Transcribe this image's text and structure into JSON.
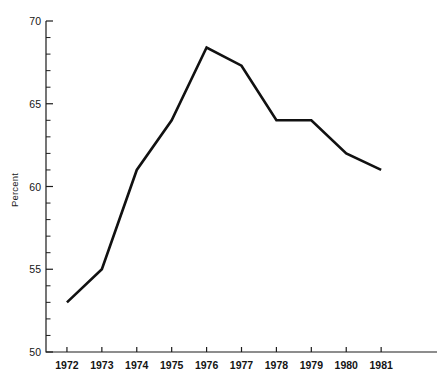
{
  "chart_data": {
    "type": "line",
    "title": "",
    "subtitle": "",
    "xlabel": "",
    "ylabel": "Percent",
    "x": [
      1972,
      1973,
      1974,
      1975,
      1976,
      1977,
      1978,
      1979,
      1980,
      1981
    ],
    "categories": [
      "1972",
      "1973",
      "1974",
      "1975",
      "1976",
      "1977",
      "1978",
      "1979",
      "1980",
      "1981"
    ],
    "values": [
      53,
      55,
      61,
      64,
      68.4,
      67.3,
      64,
      64,
      62,
      61
    ],
    "series": [
      {
        "name": "Percent",
        "values": [
          53,
          55,
          61,
          64,
          68.4,
          67.3,
          64,
          64,
          62,
          61
        ]
      }
    ],
    "ylim": [
      50,
      70
    ],
    "xlim": [
      1971.4,
      1982.6
    ],
    "y_major_ticks": [
      50,
      55,
      60,
      65,
      70
    ],
    "y_major_tick_labels": [
      "50",
      "55",
      "60",
      "65",
      "70"
    ],
    "y_minor_tick_step": 1,
    "x_ticks": [
      1972,
      1973,
      1974,
      1975,
      1976,
      1977,
      1978,
      1979,
      1980,
      1981
    ],
    "x_tick_labels": [
      "1972",
      "1973",
      "1974",
      "1975",
      "1976",
      "1977",
      "1978",
      "1979",
      "1980",
      "1981"
    ],
    "grid": false,
    "legend": false,
    "legend_position": "none",
    "annotations": [],
    "line_color": "#111111",
    "axis_color": "#1c1c1c",
    "background_color": "#ffffff"
  },
  "axes": {
    "y_title": "Percent"
  }
}
